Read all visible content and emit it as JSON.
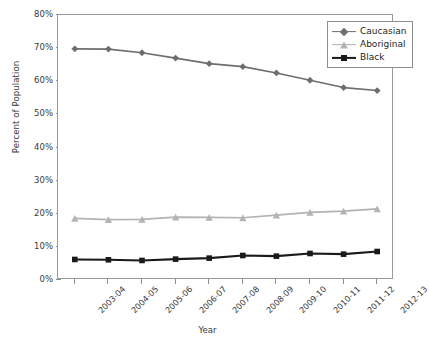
{
  "chart_data": {
    "type": "line",
    "title": "",
    "xlabel": "Year",
    "ylabel": "Percent of Population",
    "categories": [
      "2003-04",
      "2004-05",
      "2005-06",
      "2006-07",
      "2007-08",
      "2008-09",
      "2009-10",
      "2010-11",
      "2011-12",
      "2012-13"
    ],
    "ylim": [
      0,
      80
    ],
    "ytick_labels": [
      "0%",
      "10%",
      "20%",
      "30%",
      "40%",
      "50%",
      "60%",
      "70%",
      "80%"
    ],
    "ytick_values": [
      0,
      10,
      20,
      30,
      40,
      50,
      60,
      70,
      80
    ],
    "grid": false,
    "legend_position": "top-right",
    "series": [
      {
        "name": "Caucasian",
        "color": "#6e6e6e",
        "marker": "diamond",
        "values": [
          69.8,
          69.7,
          68.6,
          67.0,
          65.3,
          64.4,
          62.5,
          60.3,
          58.1,
          57.2
        ]
      },
      {
        "name": "Aboriginal",
        "color": "#b3b3b3",
        "marker": "triangle",
        "values": [
          18.6,
          18.2,
          18.3,
          19.0,
          18.9,
          18.8,
          19.6,
          20.4,
          20.8,
          21.5
        ]
      },
      {
        "name": "Black",
        "color": "#1a1a1a",
        "marker": "square",
        "values": [
          6.2,
          6.1,
          5.9,
          6.3,
          6.6,
          7.4,
          7.2,
          8.0,
          7.8,
          8.6
        ]
      }
    ]
  },
  "axes": {
    "y_title": "Percent of Population",
    "x_title": "Year"
  },
  "legend": {
    "items": [
      {
        "label": "Caucasian"
      },
      {
        "label": "Aboriginal"
      },
      {
        "label": "Black"
      }
    ]
  }
}
